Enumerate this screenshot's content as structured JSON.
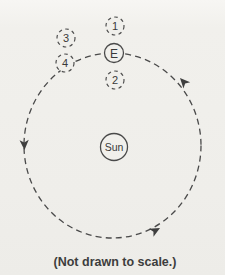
{
  "diagram": {
    "caption": "(Not drawn to scale.)",
    "orbit_direction": "counterclockwise",
    "bodies": [
      {
        "label": "1",
        "type": "dashed-position"
      },
      {
        "label": "3",
        "type": "dashed-position"
      },
      {
        "label": "E",
        "type": "earth"
      },
      {
        "label": "4",
        "type": "dashed-position"
      },
      {
        "label": "2",
        "type": "dashed-position"
      },
      {
        "label": "Sun",
        "type": "sun"
      }
    ],
    "colors": {
      "background": "#f0efeb",
      "line": "#4a4a4a",
      "text": "#3a3a3a"
    }
  }
}
